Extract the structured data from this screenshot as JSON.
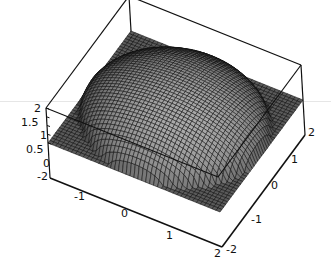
{
  "chart_data": {
    "type": "surface3d",
    "title": "",
    "function": "z = sqrt(4 - x^2 - y^2) (upper hemisphere, radius 2), z = 0 outside disk",
    "xlabel": "",
    "ylabel": "",
    "zlabel": "",
    "x_range": [
      -2,
      2
    ],
    "y_range": [
      -2,
      2
    ],
    "z_range": [
      -2,
      2
    ],
    "x_ticks": [
      "-1",
      "0",
      "1",
      "2"
    ],
    "y_ticks": [
      "-2",
      "-1",
      "0",
      "1",
      "2"
    ],
    "z_ticks": [
      "-2",
      "0",
      "0.5",
      "1",
      "1.5",
      "2"
    ],
    "box": true,
    "mesh": "dense",
    "colors": {
      "surface_dark": "#1a1a1a",
      "surface_light": "#d9d9d9",
      "box": "#111111",
      "background": "#ffffff"
    }
  },
  "labels": {
    "z": [
      {
        "text": "2",
        "x": 34,
        "y": 103
      },
      {
        "text": "1.5",
        "x": 21,
        "y": 117
      },
      {
        "text": "1",
        "x": 40,
        "y": 130
      },
      {
        "text": "0.5",
        "x": 26,
        "y": 144
      },
      {
        "text": "0",
        "x": 43,
        "y": 158
      },
      {
        "text": "-2",
        "x": 37,
        "y": 171
      }
    ],
    "x": [
      {
        "text": "-1",
        "x": 74,
        "y": 191
      },
      {
        "text": "0",
        "x": 121,
        "y": 208
      },
      {
        "text": "1",
        "x": 166,
        "y": 230
      },
      {
        "text": "2",
        "x": 214,
        "y": 248
      }
    ],
    "y": [
      {
        "text": "-2",
        "x": 226,
        "y": 244
      },
      {
        "text": "-1",
        "x": 251,
        "y": 214
      },
      {
        "text": "0",
        "x": 271,
        "y": 180
      },
      {
        "text": "1",
        "x": 291,
        "y": 154
      },
      {
        "text": "2",
        "x": 308,
        "y": 127
      }
    ]
  }
}
